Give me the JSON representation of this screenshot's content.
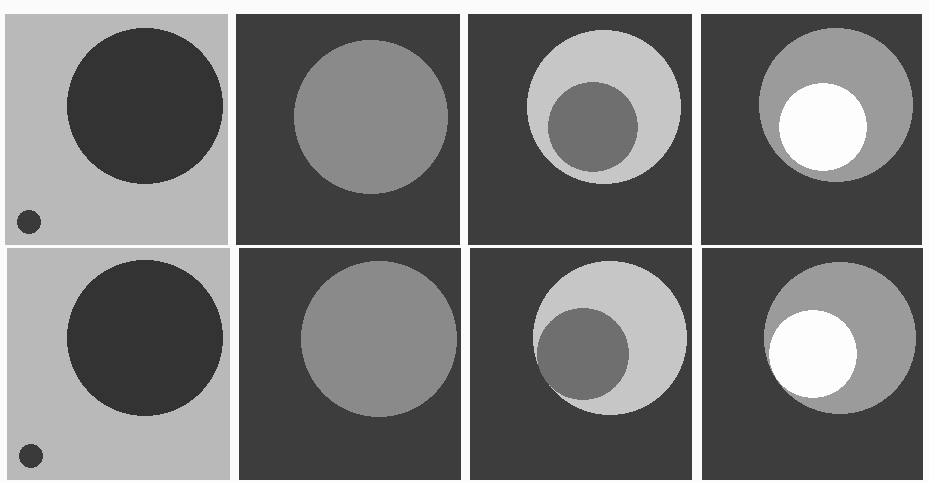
{
  "figure": {
    "layout": {
      "rows": 2,
      "cols": 4
    },
    "colors": {
      "page_background": "#fbfbfb",
      "light_background": "#b9b9b9",
      "dark_background": "#3d3d3d",
      "dark_disk": "#333333",
      "mid_disk": "#8a8a8a",
      "light_disk": "#c6c6c6",
      "inner_dark": "#6f6f6f",
      "inner_white": "#fdfdfd",
      "outer_gray": "#9b9b9b"
    },
    "panels": [
      {
        "id": "r1c1",
        "x": 5,
        "y": 14,
        "w": 223,
        "h": 231,
        "bg": "#b9b9b9",
        "shapes": [
          {
            "cx": 140,
            "cy": 92,
            "r": 78,
            "fill": "#333333"
          },
          {
            "cx": 24,
            "cy": 208,
            "r": 12,
            "fill": "#3a3a3a"
          }
        ]
      },
      {
        "id": "r1c2",
        "x": 236,
        "y": 14,
        "w": 224,
        "h": 231,
        "bg": "#3d3d3d",
        "shapes": [
          {
            "cx": 135,
            "cy": 103,
            "r": 77,
            "fill": "#8a8a8a"
          }
        ]
      },
      {
        "id": "r1c3",
        "x": 468,
        "y": 14,
        "w": 224,
        "h": 231,
        "bg": "#3d3d3d",
        "shapes": [
          {
            "cx": 136,
            "cy": 93,
            "r": 77,
            "fill": "#c6c6c6"
          },
          {
            "cx": 125,
            "cy": 113,
            "r": 45,
            "fill": "#6f6f6f"
          }
        ]
      },
      {
        "id": "r1c4",
        "x": 701,
        "y": 14,
        "w": 221,
        "h": 231,
        "bg": "#3d3d3d",
        "shapes": [
          {
            "cx": 135,
            "cy": 91,
            "r": 77,
            "fill": "#9b9b9b"
          },
          {
            "cx": 122,
            "cy": 113,
            "r": 44,
            "fill": "#fdfdfd"
          }
        ]
      },
      {
        "id": "r2c1",
        "x": 7,
        "y": 248,
        "w": 223,
        "h": 232,
        "bg": "#b9b9b9",
        "shapes": [
          {
            "cx": 138,
            "cy": 90,
            "r": 78,
            "fill": "#333333"
          },
          {
            "cx": 24,
            "cy": 208,
            "r": 12,
            "fill": "#3a3a3a"
          }
        ]
      },
      {
        "id": "r2c2",
        "x": 239,
        "y": 248,
        "w": 222,
        "h": 232,
        "bg": "#3d3d3d",
        "shapes": [
          {
            "cx": 140,
            "cy": 91,
            "r": 78,
            "fill": "#8a8a8a"
          }
        ]
      },
      {
        "id": "r2c3",
        "x": 470,
        "y": 248,
        "w": 222,
        "h": 232,
        "bg": "#3d3d3d",
        "shapes": [
          {
            "cx": 140,
            "cy": 90,
            "r": 77,
            "fill": "#c6c6c6"
          },
          {
            "cx": 113,
            "cy": 106,
            "r": 46,
            "fill": "#6f6f6f"
          }
        ]
      },
      {
        "id": "r2c4",
        "x": 702,
        "y": 248,
        "w": 221,
        "h": 232,
        "bg": "#3d3d3d",
        "shapes": [
          {
            "cx": 138,
            "cy": 90,
            "r": 76,
            "fill": "#9b9b9b"
          },
          {
            "cx": 111,
            "cy": 106,
            "r": 44,
            "fill": "#fdfdfd"
          }
        ]
      }
    ]
  }
}
